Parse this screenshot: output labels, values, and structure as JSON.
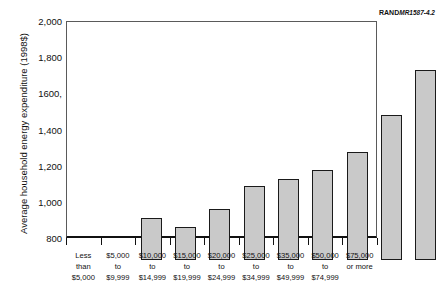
{
  "source_credit": {
    "org": "RAND",
    "doc_number": "MR1587-4.2"
  },
  "chart_data": {
    "type": "bar",
    "title": "",
    "xlabel": "",
    "ylabel": "Average household energy expenditure (1998$)",
    "ylim": [
      800,
      2000
    ],
    "ytick_labels": [
      "2,000",
      "1,800",
      "1600,",
      "1,400",
      "1,200",
      "1,000",
      "800"
    ],
    "ytick_values": [
      2000,
      1800,
      1600,
      1400,
      1200,
      1000,
      800
    ],
    "grid": false,
    "legend": "none",
    "categories": [
      "Less than $5,000",
      "$5,000 to $9,999",
      "$10,000 to $14,999",
      "$15,000 to $19,999",
      "$20,000 to $24,999",
      "$25,000 to $34,999",
      "$35,000 to $49,999",
      "$50,000 to $74,999",
      "$75,000 or more"
    ],
    "category_lines": [
      [
        "Less",
        "than",
        "$5,000"
      ],
      [
        "$5,000",
        "to",
        "$9,999"
      ],
      [
        "$10,000",
        "to",
        "$14,999"
      ],
      [
        "$15,000",
        "to",
        "$19,999"
      ],
      [
        "$20,000",
        "to",
        "$24,999"
      ],
      [
        "$25,000",
        "to",
        "$34,999"
      ],
      [
        "$35,000",
        "to",
        "$49,999"
      ],
      [
        "$50,000",
        "to",
        "$74,999"
      ],
      [
        "$75,000",
        "or more",
        ""
      ]
    ],
    "values": [
      1035,
      985,
      1080,
      1210,
      1250,
      1300,
      1400,
      1600,
      1850
    ],
    "bar_fill": "#c9c9c9",
    "bar_stroke": "#1a1a1a"
  }
}
